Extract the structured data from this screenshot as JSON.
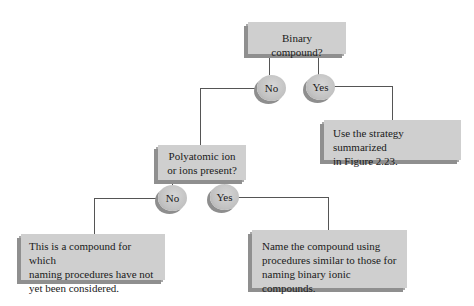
{
  "diagram": {
    "type": "decision-flowchart",
    "nodes": {
      "q1": {
        "label": "Binary compound?"
      },
      "q1_no": {
        "label": "No"
      },
      "q1_yes": {
        "label": "Yes"
      },
      "q1_yes_result": {
        "line1": "Use the strategy summarized",
        "line2": "in Figure 2.23."
      },
      "q2": {
        "line1": "Polyatomic ion",
        "line2": "or ions present?"
      },
      "q2_no": {
        "label": "No"
      },
      "q2_yes": {
        "label": "Yes"
      },
      "q2_no_result": {
        "line1": "This is a compound for which",
        "line2": "naming procedures have not",
        "line3": "yet been considered."
      },
      "q2_yes_result": {
        "line1": "Name the compound using",
        "line2": "procedures similar to those for",
        "line3": "naming binary ionic compounds."
      }
    },
    "colors": {
      "box_fill": "#cfcfcf",
      "box_shadow": "#8f8f8f",
      "connector": "#555555",
      "text": "#1a1a1a",
      "background": "#ffffff"
    }
  }
}
